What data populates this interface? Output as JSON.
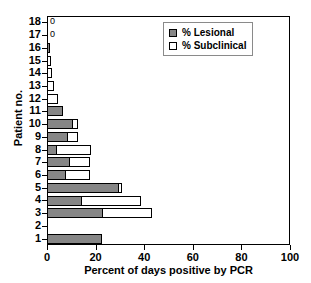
{
  "chart_data": {
    "type": "bar",
    "orientation": "horizontal",
    "stacked": true,
    "title": "",
    "xlabel": "Percent of days positive by PCR",
    "ylabel": "Patient no.",
    "xlim": [
      0,
      100
    ],
    "xticks": [
      0,
      20,
      40,
      60,
      80,
      100
    ],
    "grid": false,
    "legend_position": "top-right",
    "categories": [
      18,
      17,
      16,
      15,
      14,
      13,
      12,
      11,
      10,
      9,
      8,
      7,
      6,
      5,
      4,
      3,
      2,
      1
    ],
    "series": [
      {
        "name": "% Lesional",
        "color": "#868686",
        "values": [
          0,
          0,
          1.2,
          0,
          0,
          0,
          0,
          6.5,
          10.5,
          8.5,
          4.0,
          9.5,
          8.0,
          29.5,
          14.5,
          23.0,
          0,
          22.5
        ]
      },
      {
        "name": "% Subclinical",
        "color": "#ffffff",
        "values": [
          0,
          0,
          0,
          1.6,
          2.0,
          2.8,
          4.5,
          0,
          2.5,
          4.5,
          14.5,
          8.5,
          10.0,
          1.8,
          24.5,
          20.5,
          0,
          0
        ]
      }
    ],
    "annotations": [
      {
        "category": 18,
        "text": "0"
      },
      {
        "category": 17,
        "text": "0"
      }
    ]
  },
  "legend": {
    "items": [
      {
        "label": "% Lesional",
        "swatch": "lesional-swatch"
      },
      {
        "label": "% Subclinical",
        "swatch": "subclinical-swatch"
      }
    ]
  },
  "axes": {
    "x_title": "Percent of days positive by PCR",
    "y_title": "Patient no.",
    "x_tick_labels": [
      "0",
      "20",
      "40",
      "60",
      "80",
      "100"
    ],
    "y_tick_labels": [
      "18",
      "17",
      "16",
      "15",
      "14",
      "13",
      "12",
      "11",
      "10",
      "9",
      "8",
      "7",
      "6",
      "5",
      "4",
      "3",
      "2",
      "1"
    ]
  }
}
